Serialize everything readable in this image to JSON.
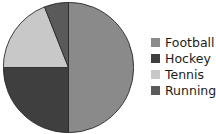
{
  "chart_data": {
    "type": "pie",
    "title": "",
    "categories": [
      "Football",
      "Hockey",
      "Tennis",
      "Running"
    ],
    "values": [
      50,
      25,
      19,
      6
    ],
    "unit": "percent",
    "colors": [
      "#8a8a8a",
      "#3f3f3f",
      "#c8c8c8",
      "#5a5a5a"
    ],
    "start_angle_deg": 0,
    "direction": "clockwise",
    "slice_angles_deg": [
      180,
      90,
      68.4,
      21.6
    ],
    "legend_position": "right",
    "grid": false,
    "xlabel": "",
    "ylabel": "",
    "slices": [
      {
        "label": "Football",
        "value": 50,
        "color": "#8a8a8a",
        "start_deg": 0,
        "end_deg": 180
      },
      {
        "label": "Hockey",
        "value": 25,
        "color": "#3f3f3f",
        "start_deg": 180,
        "end_deg": 270
      },
      {
        "label": "Tennis",
        "value": 19,
        "color": "#c8c8c8",
        "start_deg": 270,
        "end_deg": 338.4
      },
      {
        "label": "Running",
        "value": 6,
        "color": "#5a5a5a",
        "start_deg": 338.4,
        "end_deg": 360
      }
    ]
  },
  "legend": {
    "items": [
      {
        "label": "Football",
        "color": "#8a8a8a"
      },
      {
        "label": "Hockey",
        "color": "#3f3f3f"
      },
      {
        "label": "Tennis",
        "color": "#c8c8c8"
      },
      {
        "label": "Running",
        "color": "#5a5a5a"
      }
    ]
  },
  "style": {
    "background": "#ffffff",
    "slice_border": "#2b2b2b",
    "text_color": "#1c1c1c"
  }
}
